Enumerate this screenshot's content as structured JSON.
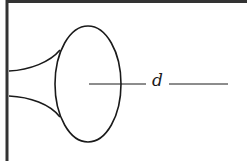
{
  "diagram": {
    "type": "horn-bell-cross-section",
    "colors": {
      "stroke": "#1a1a1a",
      "frame": "#333333",
      "background": "#ffffff"
    },
    "labels": [
      {
        "id": "d",
        "text": "d",
        "meaning": "dimension line across the bell mouth"
      }
    ]
  }
}
